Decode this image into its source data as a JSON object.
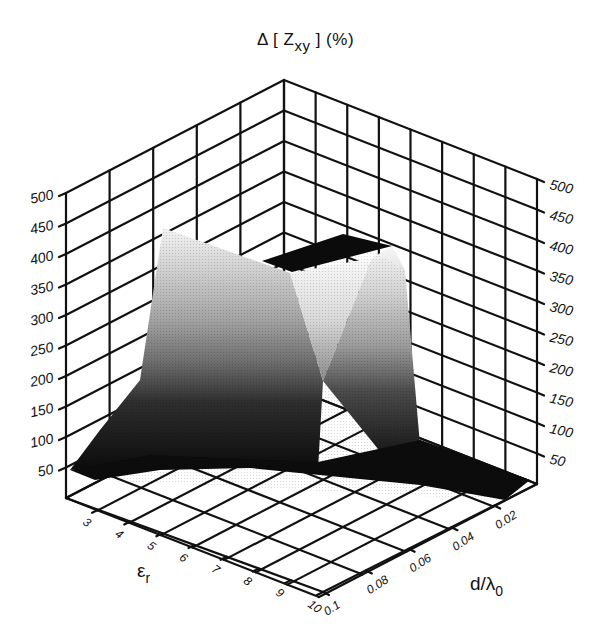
{
  "chart_data": {
    "type": "surface3d",
    "zlabel": "Δ [Z_xy] (%)",
    "xlabel": "ε_r",
    "ylabel": "d/λ_0",
    "zlim": [
      0,
      500
    ],
    "z_ticks": [
      50,
      100,
      150,
      200,
      250,
      300,
      350,
      400,
      450,
      500
    ],
    "x_ticks": [
      3,
      4,
      5,
      6,
      7,
      8,
      9,
      10
    ],
    "y_ticks": [
      0.02,
      0.04,
      0.06,
      0.08,
      0.1
    ],
    "grid": true,
    "colormap": "grayscale (dark = low, light = high)",
    "surface_description": "Tall plateau (~400-420%) over mid-range ε_r and d/λ0, with a sharp V-shaped notch dipping to ~200% near the center; surface falls to near 0-50% along the edges (low ε_r, low d/λ0); a dark flat top region near the back corner.",
    "approx_points": [
      {
        "eps_r": 3,
        "d_lambda": 0.1,
        "delta_pct": 20
      },
      {
        "eps_r": 4,
        "d_lambda": 0.08,
        "delta_pct": 420
      },
      {
        "eps_r": 6,
        "d_lambda": 0.06,
        "delta_pct": 380
      },
      {
        "eps_r": 7,
        "d_lambda": 0.05,
        "delta_pct": 200
      },
      {
        "eps_r": 8,
        "d_lambda": 0.04,
        "delta_pct": 380
      },
      {
        "eps_r": 9,
        "d_lambda": 0.03,
        "delta_pct": 400
      },
      {
        "eps_r": 10,
        "d_lambda": 0.02,
        "delta_pct": 20
      }
    ]
  },
  "labels": {
    "title_main": "Δ [ Z",
    "title_sub": "xy",
    "title_end": " ] (%)",
    "x_axis_main": "ε",
    "x_axis_sub": "r",
    "y_axis_main": "d/λ",
    "y_axis_sub": "0"
  }
}
